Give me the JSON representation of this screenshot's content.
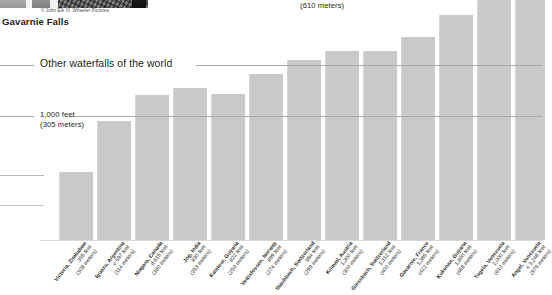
{
  "photo": {
    "credit": "© John Elk III, Wheeler Pictures",
    "caption": "Gavarnie Falls"
  },
  "annotations": {
    "section_title": "Other waterfalls of the world",
    "gridline_2000_sub": "(610 meters)",
    "gridline_1000_feet": "1,000 feet",
    "gridline_1000_meters": "(305 meters)"
  },
  "chart_data": {
    "type": "bar",
    "title": "Other waterfalls of the world",
    "xlabel": "",
    "ylabel": "Height",
    "ylim": [
      0,
      3400
    ],
    "grid": true,
    "gridlines": [
      {
        "value": 1000,
        "label": "1,000 feet",
        "sublabel": "(305 meters)"
      },
      {
        "value": 2000,
        "label": "2,000 feet",
        "sublabel": "(610 meters)"
      }
    ],
    "units": {
      "primary": "feet",
      "secondary": "meters"
    },
    "categories": [
      "Victoria, Zimbabwe",
      "Iguazu, Argentina",
      "Niagara (Horseshoe), Canada",
      "Jog, India",
      "Kaieteur Falls, Guyana",
      "Vettisfossen, Norway",
      "Staubbach, Switzerland",
      "Krimml, Austria",
      "Giessbach, Switzerland",
      "Gavarnie, France",
      "Kukenan (Cuquenan), Guyana",
      "Tugela, Venezuela",
      "Angel (Salto Angel), Venezuela"
    ],
    "values_feet": [
      355,
      597,
      815,
      830,
      822,
      899,
      984,
      1300,
      1312,
      1385,
      2000,
      2014,
      3212
    ],
    "values_meters": [
      108,
      114,
      180,
      253,
      250,
      274,
      299,
      300,
      400,
      422,
      488,
      610,
      979
    ],
    "bars": [
      {
        "name": "Victoria",
        "country": "Zimbabwe",
        "feet": "355 feet",
        "meters": "(108 meters)",
        "px_height": 68,
        "px_left": 59,
        "px_width": 34
      },
      {
        "name": "Iguazu",
        "country": "Argentina",
        "feet": "o 597 feet",
        "meters": "(114 meters)",
        "px_height": 119,
        "px_left": 97,
        "px_width": 34
      },
      {
        "name": "Niagara",
        "country": "Canada",
        "feet": "d 815 feet",
        "meters": "(180 meters)",
        "px_height": 145,
        "px_left": 135,
        "px_width": 34
      },
      {
        "name": "Jog",
        "country": "India",
        "feet": "830 feet",
        "meters": "(253 meters)",
        "px_height": 152,
        "px_left": 173,
        "px_width": 34
      },
      {
        "name": "Kaieteur",
        "country": "Guyana",
        "feet": "822 feet",
        "meters": "(250 meters)",
        "px_height": 146,
        "px_left": 211,
        "px_width": 34
      },
      {
        "name": "Vettisfossen",
        "country": "Norway",
        "feet": "899 feet",
        "meters": "(274 meters)",
        "px_height": 166,
        "px_left": 249,
        "px_width": 34
      },
      {
        "name": "Staubbach",
        "country": "Switzerland",
        "feet": "984 feet",
        "meters": "(299 meters)",
        "px_height": 180,
        "px_left": 287,
        "px_width": 34
      },
      {
        "name": "Krimml",
        "country": "Austria",
        "feet": "1,300 feet",
        "meters": "(300 meters)",
        "px_height": 189,
        "px_left": 325,
        "px_width": 34
      },
      {
        "name": "Giessbach",
        "country": "Switzerland",
        "feet": "1,312 feet",
        "meters": "(400 meters)",
        "px_height": 189,
        "px_left": 363,
        "px_width": 34
      },
      {
        "name": "Gavarnie",
        "country": "France",
        "feet": "1,385 feet",
        "meters": "(422 meters)",
        "px_height": 203,
        "px_left": 401,
        "px_width": 34
      },
      {
        "name": "Kukenan",
        "country": "Guyana",
        "feet": "1,600 feet",
        "meters": "(488 meters)",
        "px_height": 225,
        "px_left": 439,
        "px_width": 34
      },
      {
        "name": "Tugela",
        "country": "Venezuela",
        "feet": "2,000 feet",
        "meters": "(610 meters)",
        "px_height": 275,
        "px_left": 477,
        "px_width": 34
      },
      {
        "name": "Angel",
        "country": "Venezuela",
        "feet": "o 3,248 feet",
        "meters": "(979 meters)",
        "px_height": 275,
        "px_left": 515,
        "px_width": 30
      }
    ]
  }
}
